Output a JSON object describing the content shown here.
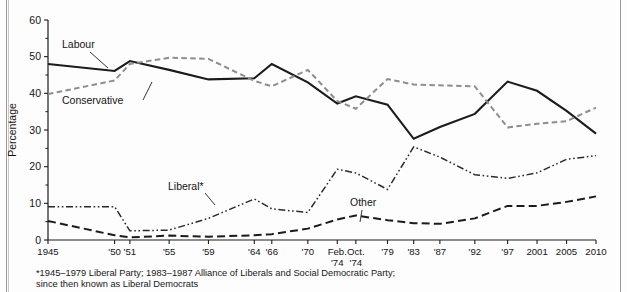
{
  "figure": {
    "background": "#ffffff",
    "footnote_lines": [
      "*1945–1979 Liberal Party; 1983–1987 Alliance of Liberals and Social Democratic Party;",
      "since then known as Liberal Democrats"
    ]
  },
  "chart_data": {
    "type": "line",
    "title": "",
    "xlabel": "",
    "ylabel": "Percentage",
    "ylim": [
      0,
      60
    ],
    "ytick_values": [
      0,
      10,
      20,
      30,
      40,
      50,
      60
    ],
    "ytick_labels": [
      "0",
      "10",
      "20",
      "30",
      "40",
      "50",
      "60"
    ],
    "yminor_values": [
      5,
      15,
      25,
      35,
      45,
      55
    ],
    "grid": false,
    "legend": "inline-annotations",
    "categories": [
      "1945",
      "'50",
      "'51",
      "'55",
      "'59",
      "'64",
      "'66",
      "'70",
      "Feb. '74",
      "Oct. '74",
      "'79",
      "'83",
      "'87",
      "'92",
      "'97",
      "2001",
      "2005",
      "2010"
    ],
    "xtick_labels": [
      "1945",
      "'50",
      "'51",
      "'55",
      "'59",
      "'64",
      "'66",
      "'70",
      "Feb.\n'74",
      "Oct.\n'74",
      "'79",
      "'83",
      "'87",
      "'92",
      "'97",
      "2001",
      "2005",
      "2010"
    ],
    "xtick_labels_line1": [
      "1945",
      "'50",
      "'51",
      "'55",
      "'59",
      "'64",
      "'66",
      "'70",
      "Feb.",
      "Oct.",
      "'79",
      "'83",
      "'87",
      "'92",
      "'97",
      "2001",
      "2005",
      "2010"
    ],
    "xtick_labels_line2": [
      "",
      "",
      "",
      "",
      "",
      "",
      "",
      "",
      "'74",
      "'74",
      "",
      "",
      "",
      "",
      "",
      "",
      "",
      ""
    ],
    "series": [
      {
        "name": "Labour",
        "style": "solid",
        "color": "#1b1b1b",
        "label_x": "'50",
        "values": [
          48.0,
          46.1,
          48.8,
          46.4,
          43.8,
          44.1,
          48.0,
          43.0,
          37.2,
          39.2,
          36.9,
          27.6,
          30.8,
          34.4,
          43.2,
          40.7,
          35.2,
          29.0
        ]
      },
      {
        "name": "Conservative",
        "style": "dashed",
        "color": "#8e8e8e",
        "label_x": "'51",
        "values": [
          39.8,
          43.5,
          48.0,
          49.7,
          49.4,
          43.4,
          41.9,
          46.4,
          37.9,
          35.8,
          43.9,
          42.4,
          42.2,
          41.9,
          30.7,
          31.7,
          32.4,
          36.1
        ]
      },
      {
        "name": "Liberal*",
        "style": "dash-dot",
        "color": "#2a2a2a",
        "label_x": "'66",
        "values": [
          9.1,
          9.1,
          2.5,
          2.7,
          5.9,
          11.2,
          8.5,
          7.5,
          19.3,
          18.3,
          13.8,
          25.4,
          22.6,
          17.8,
          16.8,
          18.3,
          22.0,
          23.0
        ]
      },
      {
        "name": "Other",
        "style": "long-dashed",
        "color": "#1b1b1b",
        "label_x": "'83",
        "values": [
          5.2,
          1.3,
          0.7,
          1.2,
          0.9,
          1.3,
          1.6,
          3.1,
          5.6,
          6.7,
          5.4,
          4.6,
          4.4,
          5.9,
          9.3,
          9.3,
          10.4,
          11.9
        ]
      }
    ],
    "annotations": [
      {
        "text": "Labour",
        "series": "Labour"
      },
      {
        "text": "Conservative",
        "series": "Conservative"
      },
      {
        "text": "Liberal*",
        "series": "Liberal*"
      },
      {
        "text": "Other",
        "series": "Other"
      }
    ]
  }
}
